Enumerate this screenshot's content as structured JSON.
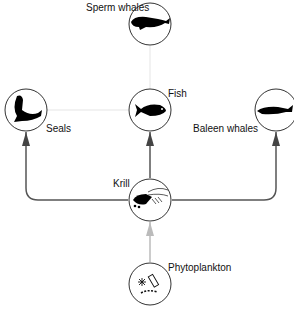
{
  "nodes": {
    "sperm_whales": {
      "label": "Sperm whales",
      "icon": "sperm-whale-icon"
    },
    "seals": {
      "label": "Seals",
      "icon": "seal-icon"
    },
    "fish": {
      "label": "Fish",
      "icon": "fish-icon"
    },
    "baleen_whales": {
      "label": "Baleen whales",
      "icon": "baleen-whale-icon"
    },
    "krill": {
      "label": "Krill",
      "icon": "krill-icon"
    },
    "phytoplankton": {
      "label": "Phytoplankton",
      "icon": "phytoplankton-icon"
    }
  },
  "edges": [
    {
      "from": "Phytoplankton",
      "to": "Krill",
      "style": "light"
    },
    {
      "from": "Krill",
      "to": "Seals",
      "style": "dark"
    },
    {
      "from": "Krill",
      "to": "Fish",
      "style": "dark"
    },
    {
      "from": "Krill",
      "to": "Baleen whales",
      "style": "dark"
    },
    {
      "from": "Fish",
      "to": "Sperm whales",
      "style": "faint"
    },
    {
      "from": "Fish",
      "to": "Seals",
      "style": "faint"
    }
  ],
  "colors": {
    "dark_line": "#555555",
    "light_line": "#bbbbbb",
    "faint_line": "#eeeeee",
    "circle": "#333333"
  }
}
